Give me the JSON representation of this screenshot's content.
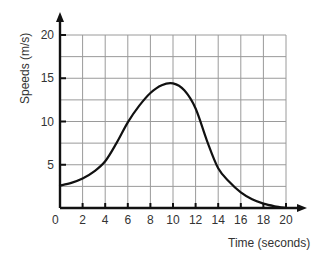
{
  "chart_data": {
    "type": "line",
    "title": "",
    "xlabel": "Time (seconds)",
    "ylabel": "Speeds (m/s)",
    "xlim": [
      0,
      20
    ],
    "ylim": [
      0,
      20
    ],
    "grid": true,
    "x_ticks": [
      0,
      2,
      4,
      6,
      8,
      10,
      12,
      14,
      16,
      18,
      20
    ],
    "y_ticks": [
      5,
      10,
      15,
      20
    ],
    "x_grid_step": 2,
    "y_grid_step": 2.5,
    "series": [
      {
        "name": "speed",
        "x": [
          0,
          1,
          2,
          3,
          4,
          5,
          6,
          7,
          8,
          9,
          10,
          11,
          12,
          13,
          14,
          15,
          16,
          17,
          18,
          19,
          20
        ],
        "y": [
          2.6,
          2.9,
          3.4,
          4.2,
          5.4,
          7.5,
          9.9,
          11.8,
          13.3,
          14.2,
          14.4,
          13.6,
          11.5,
          7.8,
          4.6,
          3.0,
          1.8,
          1.0,
          0.5,
          0.2,
          0.0
        ]
      }
    ]
  },
  "colors": {
    "line": "#111111",
    "grid": "#9a9a9a",
    "axis": "#111111"
  }
}
